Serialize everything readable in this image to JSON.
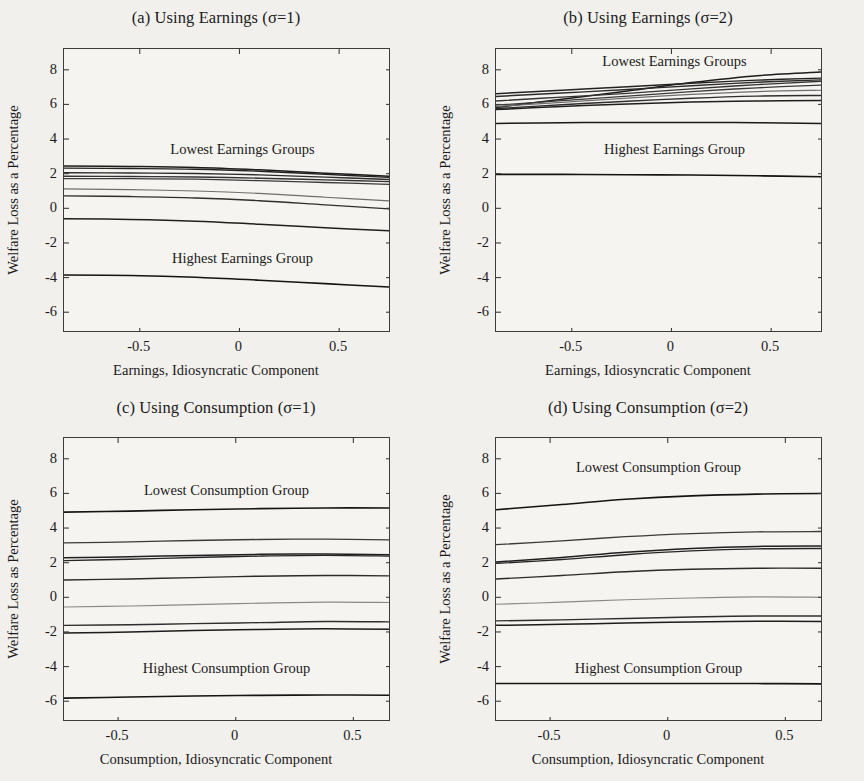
{
  "figure": {
    "background": "#f2f0ed",
    "axis_color": "#3c3c3c",
    "panel_count": 4
  },
  "chart_data": [
    {
      "id": "panel-a",
      "type": "line",
      "title": "(a) Using Earnings (σ=1)",
      "xlabel": "Earnings, Idiosyncratic Component",
      "ylabel": "Welfare Loss as a Percentage",
      "xlim": [
        -0.88,
        0.76
      ],
      "ylim": [
        -7.2,
        9.2
      ],
      "xticks": [
        -0.5,
        0,
        0.5
      ],
      "xticklabels": [
        "-0.5",
        "0",
        "0.5"
      ],
      "yticks": [
        -6,
        -4,
        -2,
        0,
        2,
        4,
        6,
        8
      ],
      "yticklabels": [
        "-6",
        "-4",
        "-2",
        "0",
        "2",
        "4",
        "6",
        "8"
      ],
      "grid": false,
      "legend": "none",
      "annotations": [
        {
          "text": "Lowest Earnings Groups",
          "x": 0.02,
          "y": 3.3
        },
        {
          "text": "Highest Earnings Group",
          "x": 0.02,
          "y": -3.0
        }
      ],
      "x": [
        -0.88,
        -0.55,
        -0.22,
        0.1,
        0.43,
        0.76
      ],
      "series": [
        {
          "name": "decile-1",
          "color": "#1c1c1c",
          "width": 1.5,
          "values": [
            2.45,
            2.42,
            2.36,
            2.22,
            2.03,
            1.85
          ]
        },
        {
          "name": "decile-2",
          "color": "#232323",
          "width": 1.4,
          "values": [
            2.32,
            2.3,
            2.26,
            2.14,
            1.96,
            1.78
          ]
        },
        {
          "name": "decile-3",
          "color": "#2b2b2b",
          "width": 1.4,
          "values": [
            2.05,
            2.04,
            2.01,
            1.93,
            1.8,
            1.66
          ]
        },
        {
          "name": "decile-4",
          "color": "#333333",
          "width": 1.4,
          "values": [
            1.85,
            1.84,
            1.81,
            1.74,
            1.64,
            1.54
          ]
        },
        {
          "name": "decile-5",
          "color": "#3a3a3a",
          "width": 1.3,
          "values": [
            1.72,
            1.71,
            1.68,
            1.6,
            1.49,
            1.38
          ]
        },
        {
          "name": "decile-6",
          "color": "#6e6e6e",
          "width": 1.2,
          "values": [
            1.12,
            1.08,
            1.0,
            0.86,
            0.64,
            0.42
          ]
        },
        {
          "name": "decile-7",
          "color": "#2e2e2e",
          "width": 1.4,
          "values": [
            0.72,
            0.68,
            0.6,
            0.44,
            0.2,
            -0.04
          ]
        },
        {
          "name": "decile-8",
          "color": "#1f1f1f",
          "width": 1.5,
          "values": [
            -0.6,
            -0.64,
            -0.74,
            -0.92,
            -1.12,
            -1.3
          ]
        },
        {
          "name": "decile-9-highest",
          "color": "#141414",
          "width": 1.6,
          "values": [
            -3.85,
            -3.88,
            -3.98,
            -4.15,
            -4.35,
            -4.55
          ]
        }
      ]
    },
    {
      "id": "panel-b",
      "type": "line",
      "title": "(b) Using Earnings (σ=2)",
      "xlabel": "Earnings, Idiosyncratic Component",
      "ylabel": "Welfare Loss as a Percentage",
      "xlim": [
        -0.88,
        0.76
      ],
      "ylim": [
        -7.2,
        9.2
      ],
      "xticks": [
        -0.5,
        0,
        0.5
      ],
      "xticklabels": [
        "-0.5",
        "0",
        "0.5"
      ],
      "yticks": [
        -6,
        -4,
        -2,
        0,
        2,
        4,
        6,
        8
      ],
      "yticklabels": [
        "-6",
        "-4",
        "-2",
        "0",
        "2",
        "4",
        "6",
        "8"
      ],
      "grid": false,
      "legend": "none",
      "annotations": [
        {
          "text": "Lowest Earnings Groups",
          "x": 0.02,
          "y": 8.4
        },
        {
          "text": "Highest Earnings Group",
          "x": 0.02,
          "y": 3.3
        }
      ],
      "x": [
        -0.88,
        -0.55,
        -0.22,
        0.1,
        0.43,
        0.76
      ],
      "series": [
        {
          "name": "decile-1",
          "color": "#1c1c1c",
          "width": 1.5,
          "values": [
            5.82,
            6.3,
            6.78,
            7.26,
            7.66,
            7.88
          ]
        },
        {
          "name": "decile-2",
          "color": "#232323",
          "width": 1.4,
          "values": [
            6.62,
            6.82,
            7.02,
            7.22,
            7.4,
            7.52
          ]
        },
        {
          "name": "decile-3",
          "color": "#2b2b2b",
          "width": 1.4,
          "values": [
            6.46,
            6.66,
            6.86,
            7.08,
            7.28,
            7.42
          ]
        },
        {
          "name": "decile-4",
          "color": "#333333",
          "width": 1.4,
          "values": [
            6.2,
            6.42,
            6.64,
            6.9,
            7.14,
            7.34
          ]
        },
        {
          "name": "decile-5",
          "color": "#3a3a3a",
          "width": 1.3,
          "values": [
            5.96,
            6.22,
            6.48,
            6.74,
            6.96,
            7.12
          ]
        },
        {
          "name": "decile-6",
          "color": "#6e6e6e",
          "width": 1.2,
          "values": [
            5.88,
            6.12,
            6.36,
            6.58,
            6.74,
            6.82
          ]
        },
        {
          "name": "decile-7",
          "color": "#2e2e2e",
          "width": 1.4,
          "values": [
            5.76,
            5.98,
            6.18,
            6.36,
            6.48,
            6.52
          ]
        },
        {
          "name": "decile-8",
          "color": "#1f1f1f",
          "width": 1.5,
          "values": [
            5.7,
            5.88,
            6.02,
            6.14,
            6.2,
            6.22
          ]
        },
        {
          "name": "decile-9",
          "color": "#1a1a1a",
          "width": 1.5,
          "values": [
            4.9,
            4.94,
            4.96,
            4.96,
            4.94,
            4.9
          ]
        },
        {
          "name": "decile-10-highest",
          "color": "#141414",
          "width": 1.6,
          "values": [
            1.96,
            1.96,
            1.94,
            1.92,
            1.88,
            1.82
          ]
        }
      ]
    },
    {
      "id": "panel-c",
      "type": "line",
      "title": "(c) Using Consumption (σ=1)",
      "xlabel": "Consumption, Idiosyncratic Component",
      "ylabel": "Welfare Loss as Percentage",
      "xlim": [
        -0.73,
        0.66
      ],
      "ylim": [
        -7.2,
        9.2
      ],
      "xticks": [
        -0.5,
        0,
        0.5
      ],
      "xticklabels": [
        "-0.5",
        "0",
        "0.5"
      ],
      "yticks": [
        -6,
        -4,
        -2,
        0,
        2,
        4,
        6,
        8
      ],
      "yticklabels": [
        "-6",
        "-4",
        "-2",
        "0",
        "2",
        "4",
        "6",
        "8"
      ],
      "grid": false,
      "legend": "none",
      "annotations": [
        {
          "text": "Lowest Consumption Group",
          "x": -0.035,
          "y": 6.1
        },
        {
          "text": "Highest Consumption Group",
          "x": -0.035,
          "y": -4.2
        }
      ],
      "x": [
        -0.73,
        -0.45,
        -0.18,
        0.1,
        0.38,
        0.66
      ],
      "series": [
        {
          "name": "group-1-lowest",
          "color": "#141414",
          "width": 1.6,
          "values": [
            4.92,
            4.98,
            5.06,
            5.12,
            5.16,
            5.16
          ]
        },
        {
          "name": "group-2",
          "color": "#3a3a3a",
          "width": 1.3,
          "values": [
            3.14,
            3.2,
            3.28,
            3.34,
            3.36,
            3.32
          ]
        },
        {
          "name": "group-3",
          "color": "#1f1f1f",
          "width": 1.5,
          "values": [
            2.28,
            2.34,
            2.42,
            2.48,
            2.5,
            2.46
          ]
        },
        {
          "name": "group-4",
          "color": "#262626",
          "width": 1.4,
          "values": [
            2.12,
            2.2,
            2.3,
            2.38,
            2.42,
            2.38
          ]
        },
        {
          "name": "group-5",
          "color": "#2b2b2b",
          "width": 1.4,
          "values": [
            1.0,
            1.06,
            1.14,
            1.22,
            1.26,
            1.24
          ]
        },
        {
          "name": "group-6",
          "color": "#8a8a8a",
          "width": 1.2,
          "values": [
            -0.56,
            -0.5,
            -0.42,
            -0.34,
            -0.28,
            -0.3
          ]
        },
        {
          "name": "group-7",
          "color": "#2e2e2e",
          "width": 1.4,
          "values": [
            -1.62,
            -1.58,
            -1.52,
            -1.46,
            -1.4,
            -1.42
          ]
        },
        {
          "name": "group-8",
          "color": "#1c1c1c",
          "width": 1.5,
          "values": [
            -2.06,
            -2.0,
            -1.92,
            -1.86,
            -1.82,
            -1.84
          ]
        },
        {
          "name": "group-9-highest",
          "color": "#141414",
          "width": 1.6,
          "values": [
            -5.82,
            -5.76,
            -5.7,
            -5.66,
            -5.64,
            -5.66
          ]
        }
      ]
    },
    {
      "id": "panel-d",
      "type": "line",
      "title": "(d) Using Consumption (σ=2)",
      "xlabel": "Consumption, Idiosyncratic Component",
      "ylabel": "Welfare Loss as a Percentage",
      "xlim": [
        -0.73,
        0.66
      ],
      "ylim": [
        -7.2,
        9.2
      ],
      "xticks": [
        -0.5,
        0,
        0.5
      ],
      "xticklabels": [
        "-0.5",
        "0",
        "0.5"
      ],
      "yticks": [
        -6,
        -4,
        -2,
        0,
        2,
        4,
        6,
        8
      ],
      "yticklabels": [
        "-6",
        "-4",
        "-2",
        "0",
        "2",
        "4",
        "6",
        "8"
      ],
      "grid": false,
      "legend": "none",
      "annotations": [
        {
          "text": "Lowest Consumption Group",
          "x": -0.035,
          "y": 7.4
        },
        {
          "text": "Highest Consumption Group",
          "x": -0.035,
          "y": -4.2
        }
      ],
      "x": [
        -0.73,
        -0.45,
        -0.18,
        0.1,
        0.38,
        0.66
      ],
      "series": [
        {
          "name": "group-1-lowest",
          "color": "#141414",
          "width": 1.6,
          "values": [
            5.06,
            5.36,
            5.66,
            5.86,
            5.96,
            6.0
          ]
        },
        {
          "name": "group-2",
          "color": "#3a3a3a",
          "width": 1.3,
          "values": [
            3.04,
            3.26,
            3.5,
            3.68,
            3.78,
            3.8
          ]
        },
        {
          "name": "group-3",
          "color": "#1f1f1f",
          "width": 1.5,
          "values": [
            2.04,
            2.3,
            2.6,
            2.82,
            2.94,
            2.96
          ]
        },
        {
          "name": "group-4",
          "color": "#262626",
          "width": 1.4,
          "values": [
            1.96,
            2.18,
            2.46,
            2.68,
            2.8,
            2.82
          ]
        },
        {
          "name": "group-5",
          "color": "#2b2b2b",
          "width": 1.4,
          "values": [
            1.06,
            1.26,
            1.48,
            1.62,
            1.68,
            1.68
          ]
        },
        {
          "name": "group-6",
          "color": "#8a8a8a",
          "width": 1.2,
          "values": [
            -0.4,
            -0.28,
            -0.14,
            -0.04,
            0.02,
            0.0
          ]
        },
        {
          "name": "group-7",
          "color": "#2e2e2e",
          "width": 1.4,
          "values": [
            -1.36,
            -1.3,
            -1.22,
            -1.14,
            -1.08,
            -1.08
          ]
        },
        {
          "name": "group-8",
          "color": "#1c1c1c",
          "width": 1.5,
          "values": [
            -1.62,
            -1.56,
            -1.48,
            -1.42,
            -1.38,
            -1.4
          ]
        },
        {
          "name": "group-9-highest",
          "color": "#141414",
          "width": 1.6,
          "values": [
            -4.98,
            -4.98,
            -4.98,
            -4.98,
            -4.98,
            -5.0
          ]
        }
      ]
    }
  ]
}
